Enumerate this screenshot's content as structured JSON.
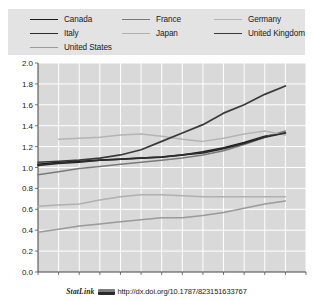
{
  "figure": {
    "background": "#ffffff",
    "plot_background": "#d9d9d9",
    "gridline_color": "#ffffff"
  },
  "legend": {
    "background": "#e3e3e3",
    "rows": [
      [
        {
          "label": "Canada",
          "color": "#1c1c1c",
          "width": 1.6
        },
        {
          "label": "France",
          "color": "#7a7a7a",
          "width": 1.6
        },
        {
          "label": "Germany",
          "color": "#b4b4b4",
          "width": 1.6
        }
      ],
      [
        {
          "label": "Italy",
          "color": "#2b2b2b",
          "width": 1.8
        },
        {
          "label": "Japan",
          "color": "#b0b0b0",
          "width": 1.6
        },
        {
          "label": "United Kingdom",
          "color": "#3a3a3a",
          "width": 1.8
        }
      ],
      [
        {
          "label": "United States",
          "color": "#9a9a9a",
          "width": 1.6
        }
      ]
    ]
  },
  "chart_data": {
    "type": "line",
    "title": "",
    "xlabel": "",
    "ylabel": "",
    "x": [
      1995,
      1996,
      1997,
      1998,
      1999,
      2000,
      2001,
      2002,
      2003,
      2004,
      2005,
      2006,
      2007,
      2008
    ],
    "xlim": [
      1995,
      2008
    ],
    "ylim": [
      0.0,
      2.0
    ],
    "yticks": [
      0.0,
      0.2,
      0.4,
      0.6,
      0.8,
      1.0,
      1.2,
      1.4,
      1.6,
      1.8,
      2.0
    ],
    "ytick_labels": [
      "0.0",
      "0.2",
      "0.4",
      "0.6",
      "0.8",
      "1.0",
      "1.2",
      "1.4",
      "1.6",
      "1.8",
      "2.0"
    ],
    "xtick_labels": [
      "1995",
      "1996",
      "1997",
      "1998",
      "1999",
      "2000",
      "2001",
      "2002",
      "2003",
      "2004",
      "2005",
      "2006",
      "2007",
      "2008"
    ],
    "grid": true,
    "legend_position": "top",
    "series": [
      {
        "name": "Canada",
        "color": "#1c1c1c",
        "width": 1.5,
        "x": [
          1995,
          1996,
          1997,
          1998,
          1999,
          2000,
          2001,
          2002,
          2003,
          2004,
          2005,
          2006,
          2007
        ],
        "values": [
          1.03,
          1.05,
          1.06,
          1.07,
          1.08,
          1.09,
          1.1,
          1.12,
          1.15,
          1.19,
          1.24,
          1.3,
          1.33
        ]
      },
      {
        "name": "France",
        "color": "#7a7a7a",
        "width": 1.5,
        "x": [
          1995,
          1996,
          1997,
          1998,
          1999,
          2000,
          2001,
          2002,
          2003,
          2004,
          2005,
          2006,
          2007
        ],
        "values": [
          0.93,
          0.96,
          0.99,
          1.01,
          1.03,
          1.05,
          1.07,
          1.09,
          1.12,
          1.16,
          1.22,
          1.29,
          1.35
        ]
      },
      {
        "name": "Germany",
        "color": "#b4b4b4",
        "width": 1.5,
        "x": [
          1996,
          1997,
          1998,
          1999,
          2000,
          2001,
          2002,
          2003,
          2004,
          2005,
          2006,
          2007
        ],
        "values": [
          1.27,
          1.28,
          1.29,
          1.31,
          1.32,
          1.3,
          1.27,
          1.25,
          1.28,
          1.32,
          1.35,
          1.31
        ]
      },
      {
        "name": "Italy",
        "color": "#2b2b2b",
        "width": 1.7,
        "x": [
          1995,
          1996,
          1997,
          1998,
          1999,
          2000,
          2001,
          2002,
          2003,
          2004,
          2005,
          2006,
          2007
        ],
        "values": [
          1.02,
          1.04,
          1.05,
          1.07,
          1.08,
          1.09,
          1.1,
          1.12,
          1.14,
          1.18,
          1.23,
          1.29,
          1.33
        ]
      },
      {
        "name": "Japan",
        "color": "#b0b0b0",
        "width": 1.5,
        "x": [
          1995,
          1996,
          1997,
          1998,
          1999,
          2000,
          2001,
          2002,
          2003,
          2004,
          2005,
          2006,
          2007
        ],
        "values": [
          0.63,
          0.64,
          0.65,
          0.69,
          0.72,
          0.74,
          0.74,
          0.73,
          0.72,
          0.72,
          0.72,
          0.72,
          0.72
        ]
      },
      {
        "name": "United Kingdom",
        "color": "#3a3a3a",
        "width": 1.7,
        "x": [
          1995,
          1996,
          1997,
          1998,
          1999,
          2000,
          2001,
          2002,
          2003,
          2004,
          2005,
          2006,
          2007
        ],
        "values": [
          1.05,
          1.06,
          1.07,
          1.09,
          1.12,
          1.17,
          1.25,
          1.33,
          1.41,
          1.52,
          1.6,
          1.7,
          1.78
        ]
      },
      {
        "name": "United States",
        "color": "#9a9a9a",
        "width": 1.5,
        "x": [
          1995,
          1996,
          1997,
          1998,
          1999,
          2000,
          2001,
          2002,
          2003,
          2004,
          2005,
          2006,
          2007
        ],
        "values": [
          0.38,
          0.41,
          0.44,
          0.46,
          0.48,
          0.5,
          0.52,
          0.52,
          0.54,
          0.57,
          0.61,
          0.65,
          0.68
        ]
      }
    ]
  },
  "footer": {
    "statlink_label": "StatLink",
    "url": "http://dx.doi.org/10.1787/823151633767"
  }
}
